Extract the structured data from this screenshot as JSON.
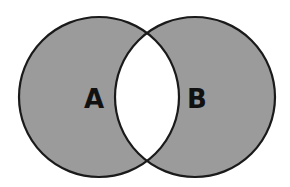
{
  "diagram": {
    "type": "venn",
    "sets": [
      {
        "label": "A",
        "shaded": true
      },
      {
        "label": "B",
        "shaded": true
      }
    ],
    "intersection": {
      "shaded": false
    },
    "colors": {
      "fill": "#9b9b9b",
      "stroke": "#1a1a1a",
      "background": "#ffffff",
      "text": "#111111"
    }
  }
}
